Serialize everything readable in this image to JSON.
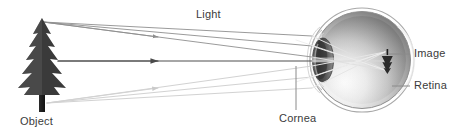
{
  "diagram": {
    "type": "optics-ray-diagram",
    "width": 460,
    "height": 134,
    "background": "#ffffff"
  },
  "labels": {
    "light": "Light",
    "object": "Object",
    "cornea": "Cornea",
    "image": "Image",
    "retina": "Retina"
  },
  "colors": {
    "text": "#3b3b3b",
    "ray_dark": "#5a5a5a",
    "ray_light": "#c9c9c9",
    "ray_mid": "#9a9a9a",
    "leader": "#8a8a8a",
    "tree_dark": "#2f2f2f",
    "tree_mid": "#555555",
    "sclera_outline": "#9d9d9d",
    "eye_dark": "#6f6f6f",
    "eye_light": "#e6e6e6",
    "lens": "#4a4a4a",
    "cornea_line": "#bdbdbd"
  },
  "parts": {
    "object_name": "pine-tree",
    "eye_name": "human-eye-cross-section",
    "image_name": "inverted-tree-image",
    "lens_name": "eye-lens",
    "cornea_name": "cornea-bulge",
    "retina_name": "retina-wall"
  },
  "rays": {
    "count": 7,
    "direction": "left-to-right",
    "arrowheads": 3,
    "description": "Light rays leave the top, middle and bottom of the object, refract at the cornea and lens, and converge to an inverted image on the retina."
  }
}
